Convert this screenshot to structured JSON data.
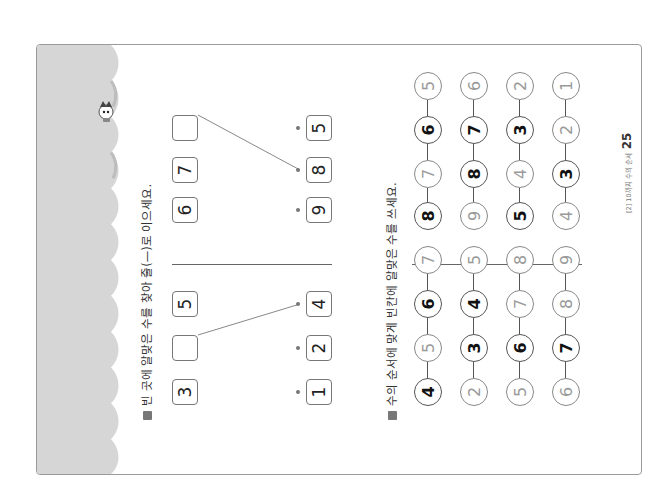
{
  "question1": {
    "title": "빈 곳에 알맞은 수를 찾아 줄(—)로 이으세요.",
    "left_group": {
      "top_boxes": [
        "3",
        "",
        "5"
      ],
      "bottom_boxes": [
        "1",
        "2",
        "4"
      ],
      "connection": {
        "from_top_index": 1,
        "to_bottom_index": 2
      }
    },
    "right_group": {
      "top_boxes": [
        "6",
        "7",
        ""
      ],
      "bottom_boxes": [
        "9",
        "8",
        "5"
      ],
      "connection": {
        "from_top_index": 2,
        "to_bottom_index": 1
      }
    }
  },
  "question2": {
    "title": "수의 순서에 맞게 빈칸에 알맞은 수를 쓰세요.",
    "left_chains": [
      [
        {
          "v": "4",
          "given": true
        },
        {
          "v": "5",
          "given": false
        },
        {
          "v": "6",
          "given": true
        },
        {
          "v": "7",
          "given": false
        }
      ],
      [
        {
          "v": "2",
          "given": false
        },
        {
          "v": "3",
          "given": true
        },
        {
          "v": "4",
          "given": true
        },
        {
          "v": "5",
          "given": false
        }
      ],
      [
        {
          "v": "5",
          "given": false
        },
        {
          "v": "6",
          "given": true
        },
        {
          "v": "7",
          "given": false
        },
        {
          "v": "8",
          "given": false
        }
      ],
      [
        {
          "v": "6",
          "given": false
        },
        {
          "v": "7",
          "given": true
        },
        {
          "v": "8",
          "given": false
        },
        {
          "v": "9",
          "given": false
        }
      ]
    ],
    "right_chains": [
      [
        {
          "v": "8",
          "given": true
        },
        {
          "v": "7",
          "given": false
        },
        {
          "v": "6",
          "given": true
        },
        {
          "v": "5",
          "given": false
        }
      ],
      [
        {
          "v": "9",
          "given": false
        },
        {
          "v": "8",
          "given": true
        },
        {
          "v": "7",
          "given": true
        },
        {
          "v": "6",
          "given": false
        }
      ],
      [
        {
          "v": "5",
          "given": true
        },
        {
          "v": "4",
          "given": false
        },
        {
          "v": "3",
          "given": true
        },
        {
          "v": "2",
          "given": false
        }
      ],
      [
        {
          "v": "4",
          "given": false
        },
        {
          "v": "3",
          "given": true
        },
        {
          "v": "2",
          "given": false
        },
        {
          "v": "1",
          "given": false
        }
      ]
    ]
  },
  "footer": {
    "chapter": "[2] 10까지 수의 순서",
    "page_number": "25"
  },
  "colors": {
    "strip": "#d6d6d6",
    "border": "#9a9a9a",
    "faint_number": "#999999"
  }
}
